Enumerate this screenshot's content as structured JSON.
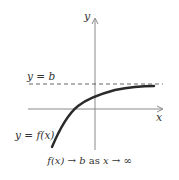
{
  "diagram": {
    "axes": {
      "x_label": "x",
      "y_label": "y"
    },
    "asymptote_label": "y = b",
    "curve_label": "y = f(x)",
    "caption": {
      "lhs": "f(x)",
      "arrow1": "→",
      "b": "b",
      "as": "as",
      "x": "x",
      "arrow2": "→",
      "inf": "∞"
    },
    "colors": {
      "curve": "#2a2a2a",
      "axes": "#8a8a8a",
      "dashed": "#555555",
      "text": "#333333"
    }
  }
}
